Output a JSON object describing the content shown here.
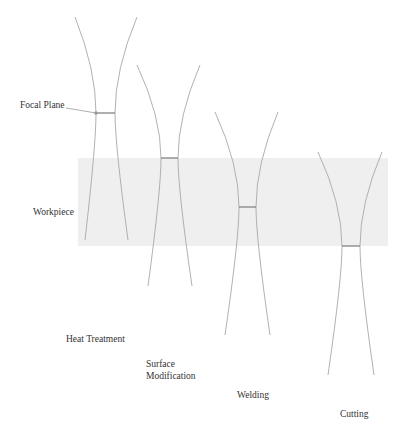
{
  "diagram": {
    "colors": {
      "background": "#ffffff",
      "beam_line": "#a8a8a8",
      "focal_line": "#7a7a7a",
      "workpiece_fill": "#efefef",
      "text": "#333333",
      "pointer": "#999999"
    },
    "labels": {
      "focal_plane": "Focal Plane",
      "workpiece": "Workpiece"
    },
    "workpiece": {
      "x": 78,
      "y": 158,
      "width": 310,
      "height": 88
    },
    "beams": [
      {
        "process": "Heat Treatment",
        "label_lines": [
          "Heat Treatment"
        ],
        "label_pos": [
          66,
          333
        ],
        "top": [
          [
            75,
            17
          ],
          [
            137,
            17
          ]
        ],
        "focal": [
          [
            96,
            113
          ],
          [
            115,
            113
          ]
        ],
        "bottom": [
          [
            85,
            240
          ],
          [
            128,
            240
          ]
        ],
        "focal_position": "above workpiece"
      },
      {
        "process": "Surface Modification",
        "label_lines": [
          "Surface",
          "Modification"
        ],
        "label_pos": [
          146,
          358
        ],
        "top": [
          [
            137,
            65
          ],
          [
            200,
            65
          ]
        ],
        "focal": [
          [
            161,
            158
          ],
          [
            178,
            158
          ]
        ],
        "bottom": [
          [
            148,
            286
          ],
          [
            192,
            286
          ]
        ],
        "focal_position": "at workpiece top surface"
      },
      {
        "process": "Welding",
        "label_lines": [
          "Welding"
        ],
        "label_pos": [
          237,
          389
        ],
        "top": [
          [
            215,
            112
          ],
          [
            278,
            112
          ]
        ],
        "focal": [
          [
            239,
            207
          ],
          [
            256,
            207
          ]
        ],
        "bottom": [
          [
            225,
            335
          ],
          [
            270,
            335
          ]
        ],
        "focal_position": "inside workpiece"
      },
      {
        "process": "Cutting",
        "label_lines": [
          "Cutting"
        ],
        "label_pos": [
          340,
          408
        ],
        "top": [
          [
            318,
            152
          ],
          [
            382,
            152
          ]
        ],
        "focal": [
          [
            342,
            246
          ],
          [
            360,
            246
          ]
        ],
        "bottom": [
          [
            328,
            375
          ],
          [
            374,
            375
          ]
        ],
        "focal_position": "at workpiece bottom surface"
      }
    ],
    "pointer": {
      "from": [
        66,
        108
      ],
      "to": [
        96,
        113
      ]
    }
  }
}
